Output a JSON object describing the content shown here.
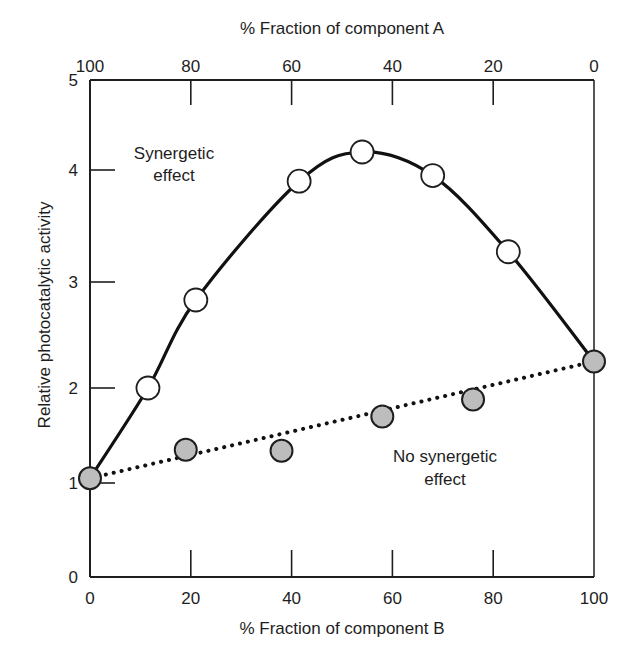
{
  "chart_data": {
    "type": "line",
    "title": "",
    "xlabel": "% Fraction of component B",
    "x2label": "% Fraction of component A",
    "ylabel": "Relative photocatalytic activity",
    "xlim": [
      0,
      100
    ],
    "ylim": [
      0,
      5
    ],
    "grid": false,
    "legend": "none (inline annotations)",
    "x_ticks": [
      0,
      20,
      40,
      60,
      80,
      100
    ],
    "x_tick_labels": [
      "0",
      "20",
      "40",
      "60",
      "80",
      "100"
    ],
    "x2_ticks": [
      0,
      20,
      40,
      60,
      80,
      100
    ],
    "x2_tick_labels": [
      "100",
      "80",
      "60",
      "40",
      "20",
      "0"
    ],
    "y_ticks": [
      0,
      1,
      2,
      3,
      4,
      5
    ],
    "y_tick_labels": [
      "0",
      "1",
      "2",
      "3",
      "4",
      "5"
    ],
    "series": [
      {
        "name": "Synergetic effect",
        "style": "solid smooth curve, open circle markers",
        "x": [
          0,
          11.5,
          21,
          41.5,
          54,
          68,
          83,
          100
        ],
        "y": [
          1.05,
          2.0,
          2.83,
          3.9,
          4.2,
          3.95,
          3.27,
          2.25
        ]
      },
      {
        "name": "No synergetic effect",
        "style": "dotted straight line, filled gray circle markers",
        "x": [
          0,
          19,
          38,
          58,
          76,
          100
        ],
        "y": [
          1.05,
          1.35,
          1.34,
          1.7,
          1.88,
          2.25
        ],
        "line_endpoints": {
          "x": [
            0,
            100
          ],
          "y": [
            1.05,
            2.25
          ]
        }
      }
    ],
    "annotations": [
      {
        "text": [
          "Synergetic",
          "effect"
        ],
        "near": "upper-left of curve"
      },
      {
        "text": [
          "No synergetic",
          "effect"
        ],
        "near": "below dotted line, right"
      }
    ]
  },
  "labels": {
    "top_axis_title": "% Fraction of component A",
    "bottom_axis_title": "% Fraction of component B",
    "y_axis_title": "Relative photocatalytic activity",
    "synergetic_line1": "Synergetic",
    "synergetic_line2": "effect",
    "nosyn_line1": "No synergetic",
    "nosyn_line2": "effect"
  },
  "colors": {
    "axis": "#1e1e1e",
    "open_marker_fill": "#ffffff",
    "filled_marker_fill": "#bdbdbd",
    "line": "#111111"
  }
}
